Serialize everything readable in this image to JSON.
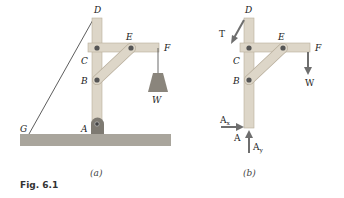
{
  "figure": {
    "caption": "Fig. 6.1",
    "panels": [
      {
        "id": "a",
        "caption": "(a)",
        "labels": {
          "D": "D",
          "E": "E",
          "F": "F",
          "C": "C",
          "B": "B",
          "W": "W",
          "G": "G",
          "A": "A"
        }
      },
      {
        "id": "b",
        "caption": "(b)",
        "labels": {
          "D": "D",
          "E": "E",
          "F": "F",
          "C": "C",
          "B": "B",
          "T": "T",
          "W": "W",
          "A": "A",
          "Ax": "A",
          "Ax_sub": "x",
          "Ay": "A",
          "Ay_sub": "y"
        }
      }
    ]
  },
  "colors": {
    "member_fill": "#ddd6c8",
    "member_stroke": "#b8ae9c",
    "ground_fill": "#a9a59c",
    "pin": "#555555",
    "bracket": "#7e7a72",
    "weight": "#8a857c",
    "arrow": "#6e6e6e"
  }
}
